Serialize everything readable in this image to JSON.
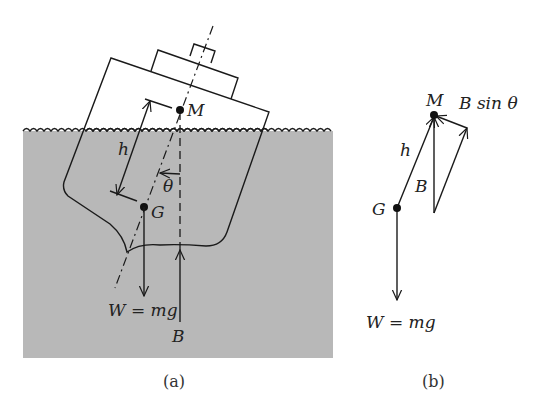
{
  "figure": {
    "panel_a": {
      "caption": "(a)",
      "labels": {
        "metacenter": "M",
        "center_of_gravity": "G",
        "height": "h",
        "angle": "θ",
        "weight": "W = mg",
        "buoyancy": "B"
      }
    },
    "panel_b": {
      "caption": "(b)",
      "labels": {
        "metacenter": "M",
        "center_of_gravity": "G",
        "height": "h",
        "buoyancy": "B",
        "restoring_component": "B sin θ",
        "weight": "W = mg"
      }
    },
    "colors": {
      "water": "#b8b8b8",
      "line": "#1a1a1a",
      "hull": "#ffffff"
    }
  }
}
